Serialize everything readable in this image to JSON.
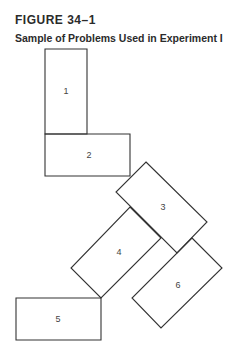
{
  "figure": {
    "label": "FIGURE 34–1",
    "title": "Sample of Problems Used in Experiment I"
  },
  "diagram": {
    "stroke_color": "#333333",
    "shapes": [
      {
        "id": "1",
        "label": "1",
        "points": "45,49 87,49 87,134 45,134",
        "label_pos": [
          66,
          92
        ]
      },
      {
        "id": "2",
        "label": "2",
        "points": "45,134 130,134 130,176 45,176",
        "label_pos": [
          89,
          156
        ]
      },
      {
        "id": "3",
        "label": "3",
        "points": "146,162 207,222 177,253 116,192",
        "label_pos": [
          163,
          208
        ]
      },
      {
        "id": "4",
        "label": "4",
        "points": "130,207 161,238 101,298 71,268",
        "label_pos": [
          119,
          253
        ]
      },
      {
        "id": "5",
        "label": "5",
        "points": "16,298 101,298 101,340 16,340",
        "label_pos": [
          58,
          320
        ]
      },
      {
        "id": "6",
        "label": "6",
        "points": "192,238 222,268 161,328 132,298",
        "label_pos": [
          178,
          286
        ]
      }
    ]
  }
}
